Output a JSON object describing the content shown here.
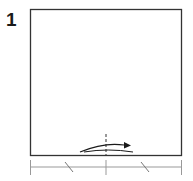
{
  "step": {
    "number": "1",
    "instruction_icon": "fold-in-half-arrow-icon"
  },
  "paper": {
    "shape": "square",
    "x": 30,
    "y": 9,
    "width": 152,
    "height": 147,
    "stroke_color": "#333333",
    "fill_color": "#ffffff"
  },
  "fold_line": {
    "type": "valley-dashed",
    "x": 106,
    "y1": 134,
    "y2": 156,
    "color": "#333333"
  },
  "fold_arrow": {
    "direction": "right",
    "from_x": 80,
    "to_x": 131,
    "color": "#1a1a1a"
  },
  "measurement_ruler": {
    "y": 167,
    "x_start": 30,
    "x_mid": 106,
    "x_end": 182,
    "tick_color": "#999999",
    "equal_marks": 2
  }
}
